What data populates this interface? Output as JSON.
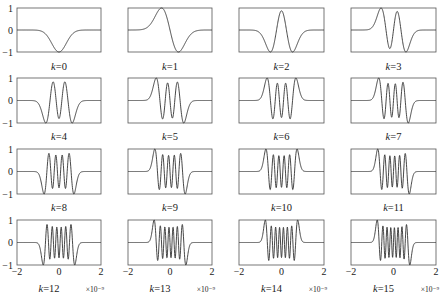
{
  "chart_data": {
    "type": "line",
    "title": "",
    "layout": {
      "rows": 4,
      "cols": 4,
      "grid": false,
      "legend": "none"
    },
    "xlabel": "",
    "ylabel": "",
    "xlim": [
      -2e-09,
      2e-09
    ],
    "ylim": [
      -1,
      1
    ],
    "x_ticks": [
      "-2",
      "0",
      "2"
    ],
    "y_ticks": [
      "1",
      "0",
      "-1"
    ],
    "x_multiplier": "×10⁻⁹",
    "x_ticks_shown_on_bottom_row_only": true,
    "y_ticks_shown_on_first_column_only": true,
    "panels": [
      {
        "k": 0,
        "label": "k=0",
        "sign": -1
      },
      {
        "k": 1,
        "label": "k=1",
        "sign": -1
      },
      {
        "k": 2,
        "label": "k=2",
        "sign": -1
      },
      {
        "k": 3,
        "label": "k=3",
        "sign": -1
      },
      {
        "k": 4,
        "label": "k=4",
        "sign": -1
      },
      {
        "k": 5,
        "label": "k=5",
        "sign": -1
      },
      {
        "k": 6,
        "label": "k=6",
        "sign": 1
      },
      {
        "k": 7,
        "label": "k=7",
        "sign": -1
      },
      {
        "k": 8,
        "label": "k=8",
        "sign": -1
      },
      {
        "k": 9,
        "label": "k=9",
        "sign": -1
      },
      {
        "k": 10,
        "label": "k=10",
        "sign": 1
      },
      {
        "k": 11,
        "label": "k=11",
        "sign": -1
      },
      {
        "k": 12,
        "label": "k=12",
        "sign": -1
      },
      {
        "k": 13,
        "label": "k=13",
        "sign": -1
      },
      {
        "k": 14,
        "label": "k=14",
        "sign": 1
      },
      {
        "k": 15,
        "label": "k=15",
        "sign": -1
      }
    ],
    "series_description": "Normalized orthogonal pulse waveforms (Hermite-type), amplitude in [-1, 1], time in seconds x 1e-9"
  },
  "style": {
    "axis_color": "#555555",
    "line_color": "#333333",
    "text_color": "#222222"
  }
}
